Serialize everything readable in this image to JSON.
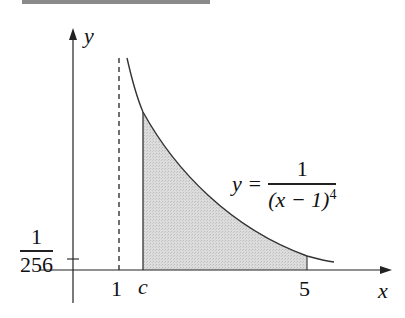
{
  "figure": {
    "y_axis_label": "y",
    "x_axis_label": "x",
    "tick_x_1": "1",
    "tick_x_c": "c",
    "tick_x_5": "5",
    "y_tick": {
      "numerator": "1",
      "denominator": "256"
    },
    "equation": {
      "lhs": "y =",
      "numerator": "1",
      "denominator_base": "(x − 1)",
      "denominator_exp": "4"
    },
    "colors": {
      "shade": "#d4d4d4",
      "curve": "#333333",
      "axis": "#222222",
      "topbar": "#8a8a8a"
    }
  }
}
